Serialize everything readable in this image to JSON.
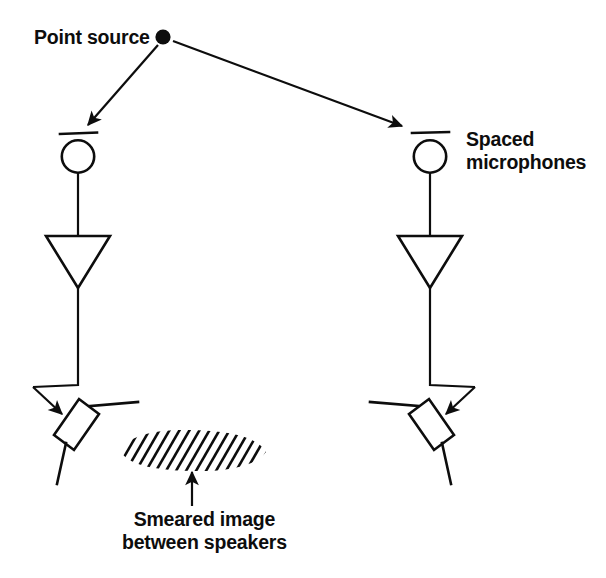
{
  "figure": {
    "type": "acoustics-diagram",
    "background_color": "#ffffff",
    "ink_color": "#0d0d0d",
    "width": 606,
    "height": 578
  },
  "labels": {
    "point_source": "Point source",
    "spaced_microphones": "Spaced\nmicrophones",
    "smeared_image": "Smeared image\nbetween speakers"
  },
  "elements": {
    "point_source_dot": {
      "name": "point-source-dot",
      "cx": 163,
      "cy": 37,
      "r": 7.5
    },
    "ray_left": {
      "name": "ray-to-left-microphone",
      "from": [
        157,
        45
      ],
      "to": [
        85,
        128
      ]
    },
    "ray_right": {
      "name": "ray-to-right-microphone",
      "from": [
        173,
        41
      ],
      "to": [
        404,
        127
      ]
    },
    "microphone_left": {
      "name": "left-microphone",
      "cx": 78,
      "cy": 156,
      "r": 16.5,
      "bar_y": 133,
      "bar_x1": 60,
      "bar_x2": 97
    },
    "microphone_right": {
      "name": "right-microphone",
      "cx": 430,
      "cy": 156,
      "r": 16.5,
      "bar_y": 133,
      "bar_x1": 412,
      "bar_x2": 449
    },
    "amplifier_left": {
      "name": "left-amplifier",
      "x1": 46,
      "x2": 110,
      "top_y": 236,
      "apex_x": 78,
      "apex_y": 288
    },
    "amplifier_right": {
      "name": "right-amplifier",
      "x1": 398,
      "x2": 462,
      "top_y": 236,
      "apex_x": 430,
      "apex_y": 288
    },
    "speaker_left": {
      "name": "left-speaker",
      "cx": 66,
      "cy": 420,
      "angle_deg": -52
    },
    "speaker_right": {
      "name": "right-speaker",
      "cx": 442,
      "cy": 420,
      "angle_deg": 52
    },
    "smeared_patch": {
      "name": "smeared-image-patch",
      "cx": 193,
      "cy": 450,
      "rx": 73,
      "ry": 21,
      "hatch_angle_deg": 50,
      "hatch_count": 26
    },
    "pointer_arrow": {
      "name": "smeared-image-pointer-arrow",
      "from": [
        192,
        505
      ],
      "to": [
        192,
        468
      ]
    }
  }
}
